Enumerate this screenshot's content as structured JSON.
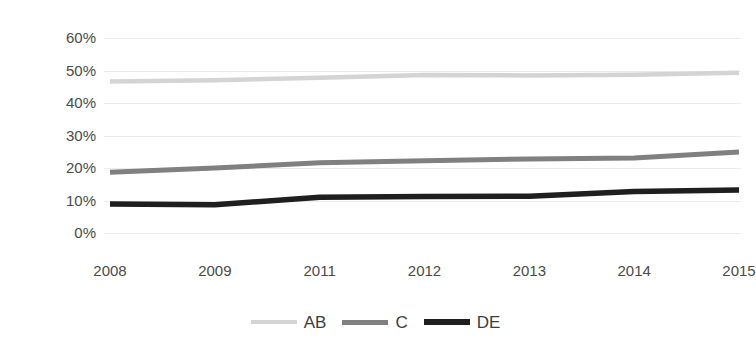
{
  "chart_data": {
    "type": "line",
    "title": "",
    "xlabel": "",
    "ylabel": "",
    "categories": [
      "2008",
      "2009",
      "2011",
      "2012",
      "2013",
      "2014",
      "2015"
    ],
    "x_tick_labels": [
      "2008",
      "2009",
      "2011",
      "2012",
      "2013",
      "2014",
      "2015"
    ],
    "y_tick_labels": [
      "60%",
      "50%",
      "40%",
      "30%",
      "20%",
      "10%",
      "0%"
    ],
    "y_tick_values": [
      60,
      50,
      40,
      30,
      20,
      10,
      0
    ],
    "ylim": [
      0,
      60
    ],
    "y_unit": "%",
    "grid": true,
    "grid_axis": "y",
    "legend_position": "bottom",
    "series": [
      {
        "name": "AB",
        "color": "#d4d4d4",
        "values": [
          46.6,
          47.0,
          47.8,
          48.6,
          48.5,
          48.7,
          49.3
        ]
      },
      {
        "name": "C",
        "color": "#808080",
        "values": [
          18.7,
          20.0,
          21.6,
          22.2,
          22.8,
          23.1,
          24.9
        ]
      },
      {
        "name": "DE",
        "color": "#1f1f1f",
        "values": [
          8.9,
          8.7,
          11.0,
          11.2,
          11.3,
          12.8,
          13.2
        ]
      }
    ]
  },
  "legend": {
    "items": [
      {
        "label": "AB",
        "color": "#d4d4d4"
      },
      {
        "label": "C",
        "color": "#808080"
      },
      {
        "label": "DE",
        "color": "#1f1f1f"
      }
    ]
  },
  "colors": {
    "background": "#ffffff",
    "gridline": "#ededed",
    "axis_text": "#4a4a4a",
    "series_ab": "#d4d4d4",
    "series_c": "#808080",
    "series_de": "#1f1f1f"
  }
}
